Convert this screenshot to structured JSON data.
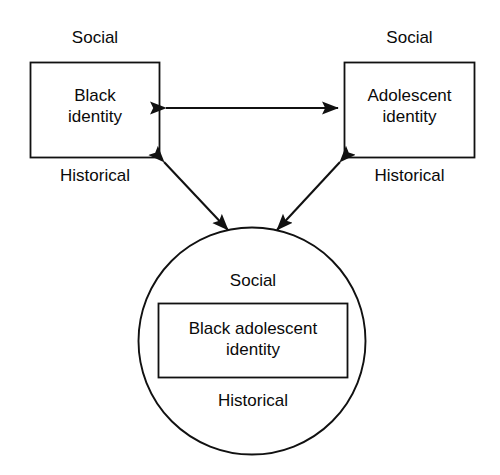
{
  "figure": {
    "background_color": "#ffffff",
    "stroke_color": "#111111"
  },
  "nodes": {
    "left_box": {
      "label": "Black\nidentity",
      "caption_top": "Social",
      "caption_bottom": "Historical"
    },
    "right_box": {
      "label": "Adolescent\nidentity",
      "caption_top": "Social",
      "caption_bottom": "Historical"
    },
    "circle": {
      "caption_top": "Social",
      "caption_bottom": "Historical",
      "inner_box_label": "Black adolescent\nidentity"
    }
  },
  "connectors": [
    {
      "name": "left-right-connector",
      "style": "double-arrow",
      "from": "left_box",
      "to": "right_box"
    },
    {
      "name": "left-circle-connector",
      "style": "double-arrow",
      "from": "left_box",
      "to": "circle"
    },
    {
      "name": "right-circle-connector",
      "style": "double-arrow",
      "from": "right_box",
      "to": "circle"
    }
  ]
}
